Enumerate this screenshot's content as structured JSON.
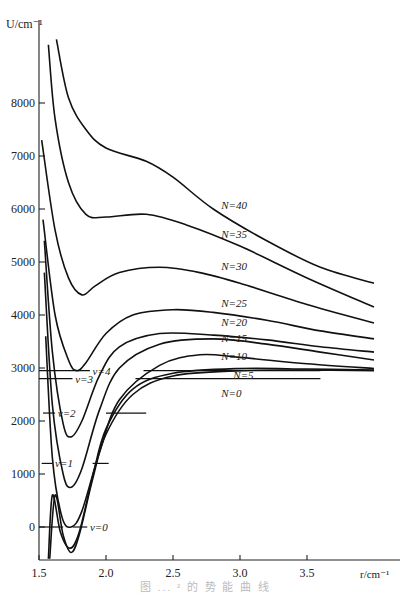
{
  "chart_data": {
    "type": "line",
    "title": "",
    "xlabel": "r/cm⁻¹",
    "ylabel": "U/cm⁻¹",
    "xlim": [
      1.5,
      4.0
    ],
    "ylim": [
      -600,
      9500
    ],
    "xticks": [
      1.5,
      2.0,
      2.5,
      3.0,
      3.5
    ],
    "xtick_labels": [
      "1.5",
      "2.0",
      "2.5",
      "3.0",
      "3.5"
    ],
    "yticks": [
      0,
      1000,
      2000,
      3000,
      4000,
      5000,
      6000,
      7000,
      8000
    ],
    "ytick_labels": [
      "0",
      "1000",
      "2000",
      "3000",
      "4000",
      "5000",
      "6000",
      "7000",
      "8000"
    ],
    "grid": false,
    "series": [
      {
        "name": "N=0",
        "label": "N=0",
        "label_pos": [
          2.86,
          2450
        ],
        "points": [
          [
            1.58,
            -600
          ],
          [
            1.62,
            600
          ],
          [
            1.68,
            -150
          ],
          [
            1.74,
            -480
          ],
          [
            1.8,
            -150
          ],
          [
            1.9,
            900
          ],
          [
            2.0,
            1750
          ],
          [
            2.2,
            2500
          ],
          [
            2.5,
            2850
          ],
          [
            3.0,
            2950
          ],
          [
            3.5,
            2960
          ],
          [
            4.0,
            2950
          ]
        ]
      },
      {
        "name": "N=5",
        "label": "N=5",
        "label_pos": [
          2.95,
          2800
        ],
        "points": [
          [
            1.57,
            -600
          ],
          [
            1.6,
            600
          ],
          [
            1.66,
            -100
          ],
          [
            1.73,
            -400
          ],
          [
            1.8,
            -100
          ],
          [
            1.9,
            950
          ],
          [
            2.0,
            1850
          ],
          [
            2.2,
            2600
          ],
          [
            2.5,
            2900
          ],
          [
            3.0,
            2990
          ],
          [
            3.5,
            2980
          ],
          [
            4.0,
            2960
          ]
        ]
      },
      {
        "name": "N=10",
        "label": "N=10",
        "label_pos": [
          2.86,
          3150
        ],
        "points": [
          [
            1.55,
            3600
          ],
          [
            1.6,
            1300
          ],
          [
            1.67,
            200
          ],
          [
            1.74,
            0
          ],
          [
            1.82,
            300
          ],
          [
            1.95,
            1400
          ],
          [
            2.1,
            2400
          ],
          [
            2.4,
            3050
          ],
          [
            2.7,
            3250
          ],
          [
            3.0,
            3200
          ],
          [
            3.5,
            3080
          ],
          [
            4.0,
            2990
          ]
        ]
      },
      {
        "name": "N=15",
        "label": "N=15",
        "label_pos": [
          2.86,
          3500
        ],
        "points": [
          [
            1.54,
            4800
          ],
          [
            1.6,
            2300
          ],
          [
            1.68,
            1000
          ],
          [
            1.74,
            750
          ],
          [
            1.82,
            1100
          ],
          [
            1.95,
            2200
          ],
          [
            2.1,
            3000
          ],
          [
            2.4,
            3450
          ],
          [
            2.8,
            3550
          ],
          [
            3.2,
            3450
          ],
          [
            3.6,
            3300
          ],
          [
            4.0,
            3150
          ]
        ]
      },
      {
        "name": "N=20",
        "label": "N=20",
        "label_pos": [
          2.86,
          3800
        ],
        "points": [
          [
            1.54,
            5400
          ],
          [
            1.6,
            3300
          ],
          [
            1.68,
            1950
          ],
          [
            1.74,
            1700
          ],
          [
            1.82,
            2000
          ],
          [
            1.95,
            2850
          ],
          [
            2.1,
            3400
          ],
          [
            2.4,
            3650
          ],
          [
            2.8,
            3620
          ],
          [
            3.2,
            3530
          ],
          [
            3.6,
            3400
          ],
          [
            4.0,
            3300
          ]
        ]
      },
      {
        "name": "N=25",
        "label": "N=25",
        "label_pos": [
          2.86,
          4150
        ],
        "points": [
          [
            1.53,
            5800
          ],
          [
            1.62,
            4000
          ],
          [
            1.72,
            3150
          ],
          [
            1.78,
            2950
          ],
          [
            1.85,
            3100
          ],
          [
            2.0,
            3650
          ],
          [
            2.2,
            4000
          ],
          [
            2.5,
            4100
          ],
          [
            2.8,
            4050
          ],
          [
            3.2,
            3900
          ],
          [
            3.6,
            3700
          ],
          [
            4.0,
            3550
          ]
        ]
      },
      {
        "name": "N=30",
        "label": "N=30",
        "label_pos": [
          2.86,
          4850
        ],
        "points": [
          [
            1.52,
            7300
          ],
          [
            1.62,
            5600
          ],
          [
            1.72,
            4700
          ],
          [
            1.82,
            4380
          ],
          [
            1.92,
            4550
          ],
          [
            2.1,
            4800
          ],
          [
            2.4,
            4900
          ],
          [
            2.7,
            4800
          ],
          [
            3.0,
            4600
          ],
          [
            3.5,
            4200
          ],
          [
            4.0,
            3850
          ]
        ]
      },
      {
        "name": "N=35",
        "label": "N=35",
        "label_pos": [
          2.86,
          5450
        ],
        "points": [
          [
            1.57,
            9100
          ],
          [
            1.62,
            7700
          ],
          [
            1.72,
            6500
          ],
          [
            1.85,
            5900
          ],
          [
            2.0,
            5850
          ],
          [
            2.3,
            5900
          ],
          [
            2.6,
            5700
          ],
          [
            3.0,
            5300
          ],
          [
            3.5,
            4700
          ],
          [
            4.0,
            4150
          ]
        ]
      },
      {
        "name": "N=40",
        "label": "N=40",
        "label_pos": [
          2.86,
          6000
        ],
        "points": [
          [
            1.63,
            9200
          ],
          [
            1.72,
            8100
          ],
          [
            1.85,
            7500
          ],
          [
            2.0,
            7150
          ],
          [
            2.3,
            6900
          ],
          [
            2.5,
            6600
          ],
          [
            2.8,
            6000
          ],
          [
            3.2,
            5400
          ],
          [
            3.6,
            4900
          ],
          [
            4.0,
            4600
          ]
        ]
      }
    ],
    "vibrational_levels": [
      {
        "name": "v=0",
        "label": "v=0",
        "energy": 0,
        "segments": [
          [
            1.5,
            1.68
          ],
          [
            1.75,
            1.86
          ]
        ],
        "label_x": 1.88
      },
      {
        "name": "v=1",
        "label": "v=1",
        "energy": 1200,
        "segments": [
          [
            1.52,
            1.6
          ],
          [
            1.9,
            2.02
          ]
        ],
        "label_x": 1.62
      },
      {
        "name": "v=2",
        "label": "v=2",
        "energy": 2150,
        "segments": [
          [
            1.53,
            1.62
          ],
          [
            2.0,
            2.3
          ]
        ],
        "label_x": 1.64
      },
      {
        "name": "v=3",
        "label": "v=3",
        "energy": 2800,
        "segments": [
          [
            1.5,
            1.75
          ],
          [
            2.22,
            3.6
          ]
        ],
        "label_x": 1.77
      },
      {
        "name": "v=4",
        "label": "v=4",
        "energy": 2950,
        "segments": [
          [
            1.5,
            1.88
          ],
          [
            2.28,
            3.6
          ]
        ],
        "label_x": 1.9
      }
    ],
    "caption": "图 ... ² 的 势 能 曲 线"
  },
  "axis": {
    "ylabel": "U/cm⁻¹",
    "xlabel": "r/cm⁻¹"
  },
  "caption": "图 ... ² 的 势 能 曲 线"
}
